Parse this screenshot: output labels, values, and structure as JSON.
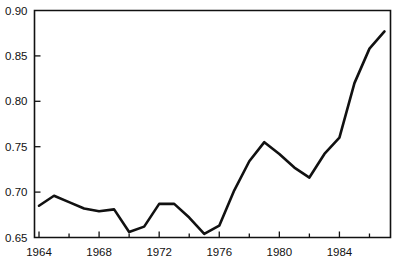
{
  "chart_data": {
    "type": "line",
    "title": "",
    "subtitle": "",
    "xlabel": "",
    "ylabel": "",
    "xlim": [
      1963.7,
      1987.4
    ],
    "ylim": [
      0.65,
      0.9
    ],
    "grid": false,
    "legend": false,
    "legend_position": "none",
    "x": [
      1964,
      1965,
      1966,
      1967,
      1968,
      1969,
      1970,
      1971,
      1972,
      1973,
      1974,
      1975,
      1976,
      1977,
      1978,
      1979,
      1980,
      1981,
      1982,
      1983,
      1984,
      1985,
      1986,
      1987
    ],
    "values": [
      0.685,
      0.696,
      0.689,
      0.682,
      0.679,
      0.681,
      0.656,
      0.662,
      0.687,
      0.687,
      0.672,
      0.654,
      0.663,
      0.702,
      0.734,
      0.755,
      0.742,
      0.727,
      0.716,
      0.742,
      0.76,
      0.82,
      0.858,
      0.877
    ],
    "series": [
      {
        "name": "series-1",
        "color": "#111111",
        "values": [
          0.685,
          0.696,
          0.689,
          0.682,
          0.679,
          0.681,
          0.656,
          0.662,
          0.687,
          0.687,
          0.672,
          0.654,
          0.663,
          0.702,
          0.734,
          0.755,
          0.742,
          0.727,
          0.716,
          0.742,
          0.76,
          0.82,
          0.858,
          0.877
        ]
      }
    ],
    "y_ticks": [
      0.65,
      0.7,
      0.75,
      0.8,
      0.85,
      0.9
    ],
    "y_tick_labels": [
      "0.65",
      "0.70",
      "0.75",
      "0.80",
      "0.85",
      "0.90"
    ],
    "x_ticks_major": [
      1964,
      1968,
      1972,
      1976,
      1980,
      1984
    ],
    "x_tick_labels_major": [
      "1964",
      "1968",
      "1972",
      "1976",
      "1980",
      "1984"
    ],
    "x_ticks_minor": [
      1966,
      1970,
      1974,
      1978,
      1982,
      1986
    ]
  },
  "colors": {
    "background": "#ffffff",
    "axis": "#111111",
    "line": "#111111",
    "text": "#111111"
  }
}
